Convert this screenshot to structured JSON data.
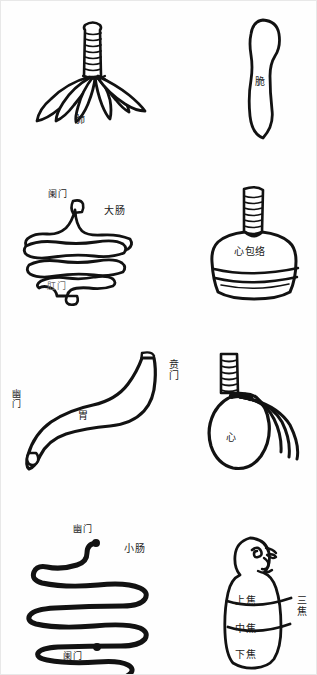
{
  "page": {
    "background_color": "#fefefe",
    "ink_color": "#121212",
    "width": 317,
    "height": 675
  },
  "figures": [
    {
      "id": "lung",
      "icon": "lung-icon",
      "label": "肺",
      "row": 1,
      "column": "left",
      "annotations": []
    },
    {
      "id": "spleen",
      "icon": "spleen-icon",
      "label": "脆",
      "row": 1,
      "column": "right",
      "annotations": []
    },
    {
      "id": "large-intestine",
      "icon": "large-intestine-icon",
      "label": "大肠",
      "row": 2,
      "column": "left",
      "annotations": [
        {
          "id": "lanmen",
          "text": "阑门"
        },
        {
          "id": "gangmen",
          "text": "肛门"
        }
      ]
    },
    {
      "id": "pericardium",
      "icon": "pericardium-icon",
      "label": "心包络",
      "row": 2,
      "column": "right",
      "annotations": []
    },
    {
      "id": "stomach",
      "icon": "stomach-icon",
      "label": "胃",
      "row": 3,
      "column": "left",
      "annotations": [
        {
          "id": "benmen",
          "text": "贲门"
        },
        {
          "id": "youmen",
          "text": "幽门"
        }
      ]
    },
    {
      "id": "heart",
      "icon": "heart-icon",
      "label": "心",
      "row": 3,
      "column": "right",
      "annotations": []
    },
    {
      "id": "small-intestine",
      "icon": "small-intestine-icon",
      "label": "小肠",
      "row": 4,
      "column": "left",
      "annotations": [
        {
          "id": "youmen",
          "text": "幽门"
        },
        {
          "id": "lanmen",
          "text": "阑门"
        }
      ]
    },
    {
      "id": "triple-burner",
      "icon": "triple-burner-icon",
      "label": "三焦",
      "row": 4,
      "column": "right",
      "annotations": [
        {
          "id": "upper-burner",
          "text": "上焦"
        },
        {
          "id": "middle-burner",
          "text": "中焦"
        },
        {
          "id": "lower-burner",
          "text": "下焦"
        }
      ]
    }
  ],
  "labels": {
    "lung": "肺",
    "spleen": "脆",
    "large_intestine": "大肠",
    "large_intestine_inlet": "阑门",
    "large_intestine_outlet": "肛门",
    "pericardium": "心包络",
    "stomach": "胃",
    "stomach_cardia": "贲门",
    "stomach_pylorus": "幽门",
    "heart": "心",
    "small_intestine": "小肠",
    "small_intestine_inlet": "幽门",
    "small_intestine_outlet": "阑门",
    "triple_burner": "三焦",
    "upper_burner": "上焦",
    "middle_burner": "中焦",
    "lower_burner": "下焦"
  }
}
